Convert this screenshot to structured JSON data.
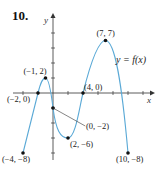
{
  "problem": {
    "number": "10."
  },
  "chart_data": {
    "type": "line",
    "title": "",
    "function_label": "y = f(x)",
    "xlabel": "x",
    "ylabel": "y",
    "xlim": [
      -5,
      11
    ],
    "ylim": [
      -9,
      9
    ],
    "grid": false,
    "tick_spacing": 1,
    "curve_color": "#5aa9d6",
    "points": [
      {
        "x": -4,
        "y": -8,
        "label": "(−4, −8)"
      },
      {
        "x": -2,
        "y": 0,
        "label": "(−2, 0)"
      },
      {
        "x": -1,
        "y": 2,
        "label": "(−1, 2)"
      },
      {
        "x": 0,
        "y": -2,
        "label": "(0, −2)"
      },
      {
        "x": 2,
        "y": -6,
        "label": "(2, −6)"
      },
      {
        "x": 4,
        "y": 0,
        "label": "(4, 0)"
      },
      {
        "x": 7,
        "y": 7,
        "label": "(7, 7)"
      },
      {
        "x": 10,
        "y": -8,
        "label": "(10, −8)"
      }
    ]
  }
}
